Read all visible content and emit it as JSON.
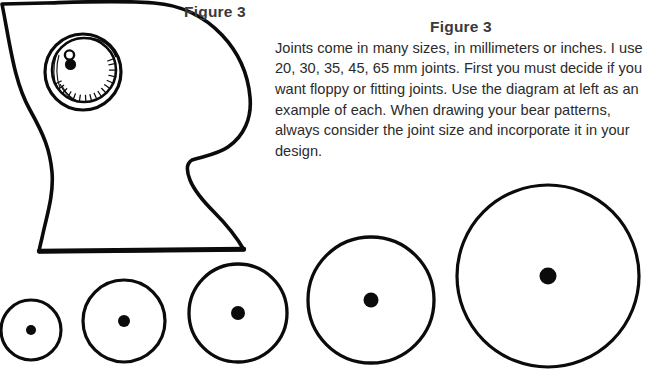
{
  "page": {
    "width": 647,
    "height": 379,
    "background": "#ffffff",
    "ink_color": "#000000",
    "text_color": "#2b2b2b",
    "caption_color": "#3a3a3a"
  },
  "caption_left": {
    "label": "Figure 3"
  },
  "text_block": {
    "title": "Figure 3",
    "body": "Joints come in many sizes, in millimeters or inches. I use 20, 30, 35, 45, 65 mm joints. First you must decide if you want floppy or fitting joints. Use the diagram at left as an example of each. When drawing your bear patterns, always consider the joint size and incorporate it in your design.",
    "lines": [
      "Joints come in many sizes, in millimeters or inches.",
      "I use 20, 30, 35, 45, 65 mm joints. First you must",
      "decide if you want floppy or fitting joints. Use the",
      "diagram at left as an example of each. When drawing",
      "your bear patterns, always consider the joint size and",
      "incorporate it in your design."
    ],
    "joint_sizes_mm": [
      20,
      30,
      35,
      45,
      65
    ]
  },
  "diagram": {
    "name": "bear-body-with-joint",
    "joint_disc": {
      "outer_center": [
        83,
        72
      ],
      "outer_radius": 38,
      "inner_center": [
        84,
        70
      ],
      "inner_radius": 32,
      "cotter_pin_center": [
        70,
        60
      ],
      "hatched": true
    }
  },
  "joint_circles": {
    "count": 5,
    "label": "Row of joint discs shown actual size, smallest to largest",
    "items": [
      {
        "name": "joint-circle-20mm",
        "size_mm": 20,
        "cx": 31,
        "cy": 330,
        "r": 30,
        "dot_r": 5.0
      },
      {
        "name": "joint-circle-30mm",
        "size_mm": 30,
        "cx": 124,
        "cy": 321,
        "r": 41,
        "dot_r": 6.0
      },
      {
        "name": "joint-circle-35mm",
        "size_mm": 35,
        "cx": 238,
        "cy": 313,
        "r": 49,
        "dot_r": 7.0
      },
      {
        "name": "joint-circle-45mm",
        "size_mm": 45,
        "cx": 371,
        "cy": 300,
        "r": 63,
        "dot_r": 7.5
      },
      {
        "name": "joint-circle-65mm",
        "size_mm": 65,
        "cx": 548,
        "cy": 276,
        "r": 91,
        "dot_r": 8.5
      }
    ]
  }
}
